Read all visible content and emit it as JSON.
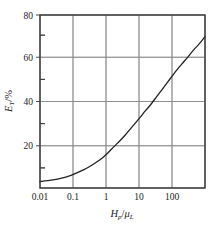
{
  "chart_data": {
    "type": "line",
    "title": "",
    "subtitle": "",
    "xlabel": "Hp/μL",
    "xlabel_parts": {
      "var1": "H",
      "sub1": "p",
      "slash": "/",
      "var2": "μ",
      "sub2": "L"
    },
    "ylabel": "ET/%",
    "ylabel_parts": {
      "var": "E",
      "sub": "T",
      "slash": "/",
      "unit": "%"
    },
    "xscale": "log",
    "yscale": "linear",
    "xlim": [
      0.01,
      300
    ],
    "ylim": [
      0,
      80
    ],
    "grid": true,
    "grid_axes": "both",
    "legend": "none",
    "xticks": [
      0.01,
      0.1,
      1,
      10,
      100
    ],
    "xtick_labels": [
      "0.01",
      "0.1",
      "1",
      "10",
      "100"
    ],
    "yticks": [
      0,
      20,
      40,
      60,
      80
    ],
    "ytick_labels": [
      "0",
      "20",
      "40",
      "60",
      "80"
    ],
    "ytick_labels_shown": [
      "20",
      "40",
      "60",
      "80"
    ],
    "yminorticks": [
      10,
      30,
      50,
      70
    ],
    "series": [
      {
        "name": "ET",
        "color": "#222222",
        "x": [
          0.01,
          0.02,
          0.03,
          0.05,
          0.07,
          0.1,
          0.15,
          0.2,
          0.3,
          0.5,
          0.7,
          1,
          1.5,
          2,
          3,
          5,
          7,
          10,
          15,
          20,
          30,
          50,
          70,
          100,
          150,
          200,
          300
        ],
        "y": [
          3.0,
          3.6,
          4.1,
          5.0,
          5.8,
          7.0,
          8.4,
          9.5,
          11.3,
          14.0,
          16.3,
          19.0,
          22.0,
          24.3,
          27.8,
          32.3,
          35.4,
          38.5,
          42.5,
          45.3,
          49.3,
          54.3,
          57.3,
          60.3,
          64.0,
          66.3,
          70.0
        ]
      }
    ],
    "annotations": []
  },
  "figure": {
    "background": "#ffffff",
    "frame_color": "#3a3a3a",
    "grid_color": "#8c8c8c",
    "curve_color": "#222222"
  }
}
